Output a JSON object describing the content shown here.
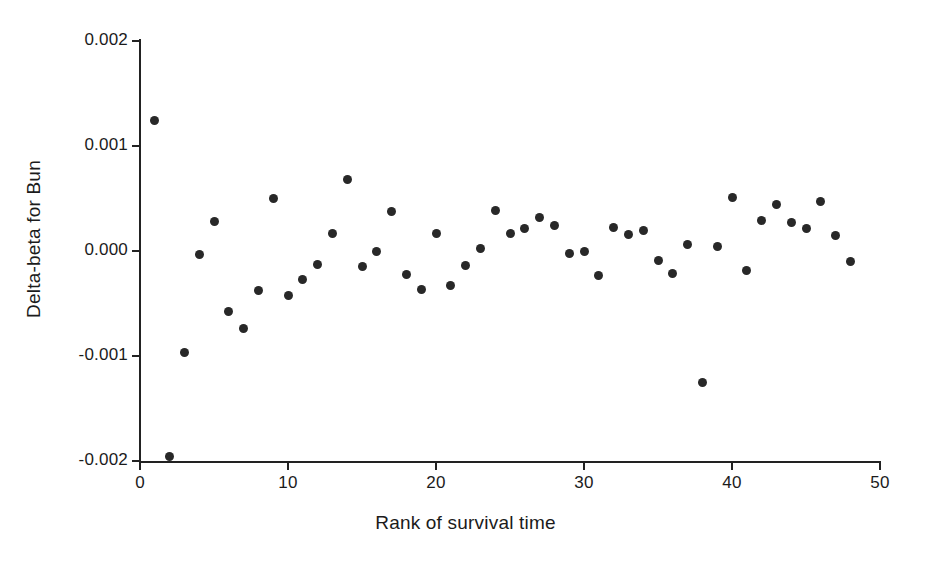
{
  "figure": {
    "background_color": "#ffffff",
    "marker_color": "#282828",
    "axis_color": "#222222"
  },
  "axes": {
    "x_title": "Rank of survival time",
    "y_title": "Delta-beta for Bun",
    "x_tick_labels": [
      "0",
      "10",
      "20",
      "30",
      "40",
      "50"
    ],
    "y_tick_labels": [
      "0.002",
      "0.001",
      "0.000",
      "-0.001",
      "-0.002"
    ]
  },
  "chart_data": {
    "type": "scatter",
    "title": "",
    "xlabel": "Rank of survival time",
    "ylabel": "Delta-beta for Bun",
    "xlim": [
      0,
      50
    ],
    "ylim": [
      -0.002,
      0.002
    ],
    "xticks": [
      0,
      10,
      20,
      30,
      40,
      50
    ],
    "yticks": [
      -0.002,
      -0.001,
      0.0,
      0.001,
      0.002
    ],
    "grid": false,
    "legend": false,
    "marker": "filled-circle",
    "series": [
      {
        "name": "Delta-beta for Bun",
        "x": [
          1,
          2,
          3,
          4,
          5,
          6,
          7,
          8,
          9,
          10,
          11,
          12,
          13,
          14,
          15,
          16,
          17,
          18,
          19,
          20,
          21,
          22,
          23,
          24,
          25,
          26,
          27,
          28,
          29,
          30,
          31,
          32,
          33,
          34,
          35,
          36,
          37,
          38,
          39,
          40,
          41,
          42,
          43,
          44,
          45,
          46,
          47,
          48
        ],
        "y": [
          0.00124,
          -0.00196,
          -0.00097,
          -3e-05,
          0.00028,
          -0.00058,
          -0.00074,
          -0.00038,
          0.0005,
          -0.00042,
          -0.00027,
          -0.00013,
          0.00017,
          0.00068,
          -0.00015,
          0.0,
          0.00038,
          -0.00022,
          -0.00037,
          0.00017,
          -0.00033,
          -0.00014,
          2e-05,
          0.00039,
          0.00017,
          0.00021,
          0.00032,
          0.00024,
          -2e-05,
          0.0,
          -0.00023,
          0.00022,
          0.00016,
          0.0002,
          -9e-05,
          -0.00021,
          6e-05,
          -0.00125,
          4e-05,
          0.00051,
          -0.00019,
          0.00029,
          0.00044,
          0.00027,
          0.00021,
          0.00047,
          0.00015,
          -0.0001
        ]
      }
    ]
  }
}
